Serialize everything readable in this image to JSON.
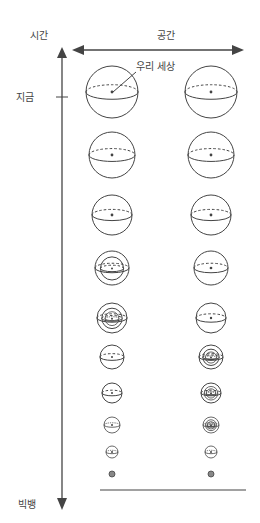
{
  "labels": {
    "time_axis": "시간",
    "space_axis": "공간",
    "our_world": "우리 세상",
    "now": "지금",
    "big_bang": "빅뱅"
  },
  "colors": {
    "stroke": "#444444",
    "text": "#444444",
    "background": "#ffffff"
  },
  "layout": {
    "left_column_x": 112,
    "right_column_x": 211,
    "time_axis_x": 62
  },
  "spheres": [
    {
      "row": 1,
      "y": 92,
      "r": 26,
      "left_nested": 0,
      "right_nested": 0
    },
    {
      "row": 2,
      "y": 155,
      "r": 23,
      "left_nested": 0,
      "right_nested": 0
    },
    {
      "row": 3,
      "y": 215,
      "r": 20,
      "left_nested": 0,
      "right_nested": 0
    },
    {
      "row": 4,
      "y": 268,
      "r": 17,
      "left_nested": 1,
      "right_nested": 0
    },
    {
      "row": 5,
      "y": 318,
      "r": 15,
      "left_nested": 2,
      "right_nested": 0
    },
    {
      "row": 6,
      "y": 357,
      "r": 12,
      "left_nested": 0,
      "right_nested": 2
    },
    {
      "row": 7,
      "y": 393,
      "r": 10,
      "left_nested": 0,
      "right_nested": 2
    },
    {
      "row": 8,
      "y": 425,
      "r": 8,
      "left_nested": 0,
      "right_nested": 2
    },
    {
      "row": 9,
      "y": 452,
      "r": 6,
      "left_nested": 0,
      "right_nested": 0
    },
    {
      "row": 10,
      "y": 474,
      "r": 3,
      "left_nested": 0,
      "right_nested": 0
    }
  ]
}
